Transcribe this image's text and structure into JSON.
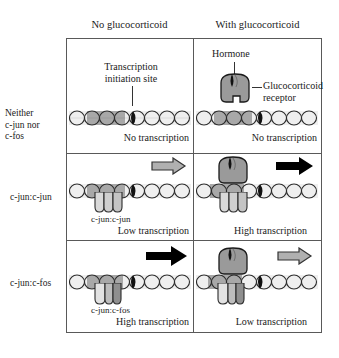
{
  "figure": {
    "columns": [
      {
        "id": "no-glucocorticoid",
        "label": "No glucocorticoid"
      },
      {
        "id": "with-glucocorticoid",
        "label": "With glucocorticoid"
      }
    ],
    "rows": [
      {
        "id": "neither",
        "label_lines": [
          "Neither",
          "c-jun nor",
          "c-fos"
        ],
        "label": "Neither c-jun nor c-fos"
      },
      {
        "id": "c-jun-c-jun",
        "label_lines": [
          "c-jun:c-jun"
        ],
        "label": "c-jun:c-jun"
      },
      {
        "id": "c-jun-c-fos",
        "label_lines": [
          "c-jun:c-fos"
        ],
        "label": "c-jun:c-fos"
      }
    ]
  },
  "annotations": {
    "transcription_site_line1": "Transcription",
    "transcription_site_line2": "initiation site",
    "hormone": "Hormone",
    "receptor_line1": "Glucocorticoid",
    "receptor_line2": "receptor"
  },
  "cells": {
    "r1c1": {
      "caption": "No transcription",
      "arrow": "none",
      "complex_label": ""
    },
    "r1c2": {
      "caption": "No transcription",
      "arrow": "none",
      "complex_label": ""
    },
    "r2c1": {
      "caption": "Low transcription",
      "arrow": "gray",
      "complex_label": "c-jun:c-jun"
    },
    "r2c2": {
      "caption": "High transcription",
      "arrow": "black",
      "complex_label": ""
    },
    "r3c1": {
      "caption": "High transcription",
      "arrow": "black",
      "complex_label": "c-jun:c-fos"
    },
    "r3c2": {
      "caption": "Low transcription",
      "arrow": "gray",
      "complex_label": ""
    }
  },
  "colors": {
    "frame": "#595959",
    "text": "#1a1a1a",
    "arrow_black": "#000000",
    "arrow_gray": "#b0b0b0",
    "arrow_gray_outline": "#333333",
    "dna_band": "#efefef",
    "dna_stroke": "#2b2b2b",
    "dna_dark_segment": "#111111",
    "receptor_body": "#9a9a9a",
    "hormone": "#111111",
    "c_jun_light": "#d9d9d9",
    "c_fos_dark": "#8f8f8f",
    "background": "#ffffff"
  }
}
